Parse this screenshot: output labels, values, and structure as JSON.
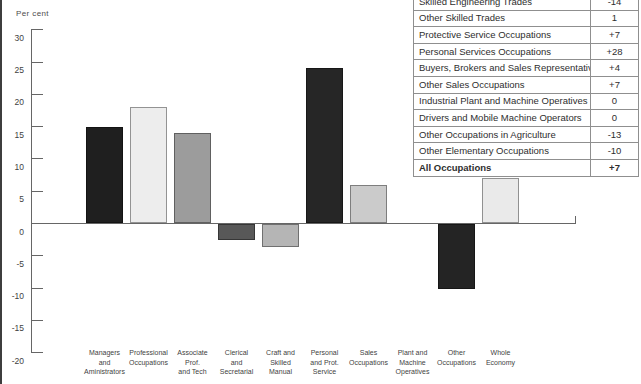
{
  "page": {
    "y_axis_title": "Per cent"
  },
  "chart_data": {
    "type": "bar",
    "title": "",
    "xlabel": "",
    "ylabel": "Per cent",
    "ylim": [
      -20,
      30
    ],
    "ytick_step": 5,
    "grid": false,
    "legend_position": "none",
    "categories": [
      "Managers and Aministrators",
      "Professional Occupations",
      "Associate Prof. and Tech",
      "Clerical and Secretarial",
      "Craft and Skilled Manual",
      "Personal and Prot. Service",
      "Sales Occupations",
      "Plant and Machine Operatives",
      "Other Occupations",
      "Whole Economy"
    ],
    "category_label_lines": [
      [
        "Managers",
        "and",
        "Aministrators"
      ],
      [
        "Professional",
        "Occupations"
      ],
      [
        "Associate",
        "Prof.",
        "and Tech"
      ],
      [
        "Clerical",
        "and",
        "Secretarial"
      ],
      [
        "Craft and",
        "Skilled",
        "Manual"
      ],
      [
        "Personal",
        "and Prot.",
        "Service"
      ],
      [
        "Sales",
        "Occupations"
      ],
      [
        "Plant and",
        "Machine",
        "Operatives"
      ],
      [
        "Other",
        "Occupations"
      ],
      [
        "Whole",
        "Economy"
      ]
    ],
    "values": [
      15,
      18,
      14,
      -2.5,
      -3.5,
      24,
      6,
      0,
      -10,
      7
    ],
    "bar_colors": [
      "#1f1f1f",
      "#ededed",
      "#9c9c9c",
      "#585858",
      "#b5b5b5",
      "#262626",
      "#cbcbcb",
      "#cbcbcb",
      "#242424",
      "#eaeaea"
    ],
    "axis_color": "#666666"
  },
  "table": {
    "value_column_note": "percentage change",
    "rows": [
      {
        "label": "Skilled Engineering Trades",
        "value": "-14",
        "bold": false
      },
      {
        "label": "Other Skilled Trades",
        "value": "1",
        "bold": false
      },
      {
        "label": "Protective Service Occupations",
        "value": "+7",
        "bold": false
      },
      {
        "label": "Personal Services Occupations",
        "value": "+28",
        "bold": false
      },
      {
        "label": "Buyers, Brokers and Sales Representatives",
        "value": "+4",
        "bold": false
      },
      {
        "label": "Other Sales Occupations",
        "value": "+7",
        "bold": false
      },
      {
        "label": "Industrial Plant and Machine Operatives",
        "value": "0",
        "bold": false
      },
      {
        "label": "Drivers and Mobile Machine Operators",
        "value": "0",
        "bold": false
      },
      {
        "label": "Other Occupations in Agriculture",
        "value": "-13",
        "bold": false
      },
      {
        "label": "Other Elementary Occupations",
        "value": "-10",
        "bold": false
      },
      {
        "label": "All Occupations",
        "value": "+7",
        "bold": true
      }
    ]
  }
}
